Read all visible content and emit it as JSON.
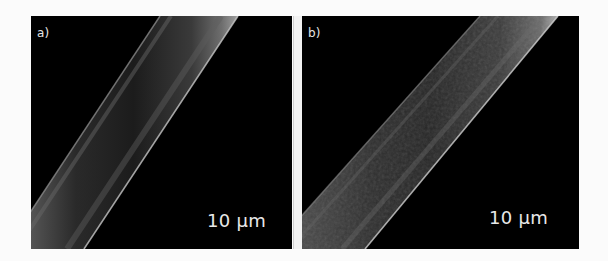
{
  "figure": {
    "panels": [
      {
        "id": "a",
        "label": "a)",
        "scale_bar_text": "10 µm",
        "description": "SEM micrograph of a smooth fiber running diagonally"
      },
      {
        "id": "b",
        "label": "b)",
        "scale_bar_text": "10 µm",
        "description": "SEM micrograph of a wider fiber with rough surface running diagonally"
      }
    ],
    "colors": {
      "background": "#000000",
      "text": "#e8e8e8",
      "divider": "#f2f2f2",
      "page": "#fbfbfb"
    }
  }
}
